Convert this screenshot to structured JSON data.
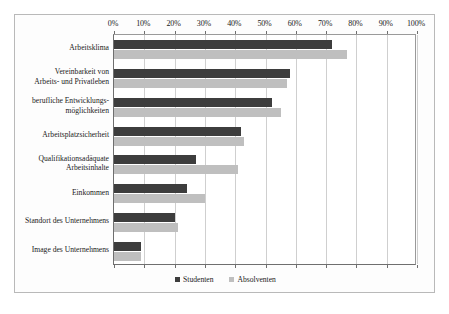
{
  "chart_data": {
    "type": "bar",
    "orientation": "horizontal",
    "title": "",
    "subtitle": "",
    "xlabel": "",
    "ylabel": "",
    "xlim": [
      0,
      100
    ],
    "xtick_labels": [
      "0%",
      "10%",
      "20%",
      "30%",
      "40%",
      "50%",
      "60%",
      "70%",
      "80%",
      "90%",
      "100%"
    ],
    "xtick_values": [
      0,
      10,
      20,
      30,
      40,
      50,
      60,
      70,
      80,
      90,
      100
    ],
    "grid": true,
    "legend_position": "bottom-center",
    "categories": [
      "Arbeitsklima",
      "Vereinbarkeit von\nArbeits- und Privatleben",
      "berufliche Entwicklungs-\nmöglichkeiten",
      "Arbeitsplatzsicherheit",
      "Qualifikationsadäquate\nArbeitsinhalte",
      "Einkommen",
      "Standort des Unternehmens",
      "Image des Unternehmens"
    ],
    "series": [
      {
        "name": "Studenten",
        "color": "#3d3d3d",
        "values": [
          72,
          58,
          52,
          42,
          27,
          24,
          20,
          9
        ]
      },
      {
        "name": "Absolventen",
        "color": "#bfbfbf",
        "values": [
          77,
          57,
          55,
          43,
          41,
          30,
          21,
          9
        ]
      }
    ]
  },
  "legend": {
    "items": [
      {
        "label": "Studenten",
        "color": "#3d3d3d"
      },
      {
        "label": "Absolventen",
        "color": "#bfbfbf"
      }
    ]
  }
}
